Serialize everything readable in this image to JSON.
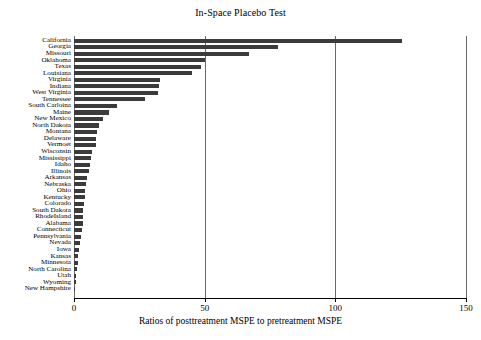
{
  "figure": {
    "title": "In-Space Placebo Test",
    "xlabel": "Ratios of posttreatment MSPE to pretreatment MSPE",
    "bar_color": "#3b3b3b",
    "grid_color": "#6a6a6a",
    "axis_color": "#000000"
  },
  "chart_data": {
    "type": "bar",
    "orientation": "horizontal",
    "title": "In-Space Placebo Test",
    "xlabel": "Ratios of posttreatment MSPE to pretreatment MSPE",
    "ylabel": "",
    "xlim": [
      0,
      150
    ],
    "xticks": [
      0,
      50,
      100,
      150
    ],
    "xticklabels": [
      "0",
      "50",
      "100",
      "150"
    ],
    "grid": "vertical gridlines at 0, 50, 100, 150",
    "legend": "none",
    "categories": [
      "California",
      "Georgia",
      "Missouri",
      "Oklahoma",
      "Texas",
      "Louisiana",
      "Virginia",
      "Indiana",
      "West Virginia",
      "Tennessee",
      "South Carloina",
      "Maine",
      "New Mexico",
      "North Dakota",
      "Montana",
      "Delaware",
      "Vermoet",
      "Wisconsin",
      "Mississippi",
      "Idaho",
      "Illinois",
      "Arkansas",
      "Nebraska",
      "Ohio",
      "Kentucky",
      "Colorado",
      "South Dakota",
      "RhodeIsland",
      "Alabama",
      "Connecticut",
      "Pennsylvania",
      "Nevada",
      "Iowa",
      "Kansas",
      "Minnesota",
      "North Carolina",
      "Utah",
      "Wyoming",
      "New Hampshire"
    ],
    "values": [
      125.5,
      78.2,
      66.8,
      50.2,
      48.5,
      45.0,
      33.0,
      32.5,
      32.0,
      27.0,
      16.5,
      13.5,
      11.0,
      9.5,
      8.8,
      8.6,
      8.5,
      7.0,
      6.6,
      6.3,
      5.6,
      5.0,
      4.6,
      4.3,
      4.1,
      3.8,
      3.6,
      3.5,
      3.3,
      3.1,
      2.8,
      2.4,
      2.1,
      1.7,
      1.4,
      1.1,
      0.9,
      0.7,
      0.4
    ]
  }
}
